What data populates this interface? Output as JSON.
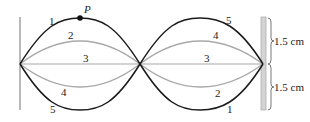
{
  "diagram": {
    "type": "standing-wave",
    "point_label": "P",
    "curves": [
      {
        "id": 1,
        "label_left": "1",
        "label_right": "1",
        "color": "#1a1a1a"
      },
      {
        "id": 2,
        "label_left": "2",
        "label_right": "2",
        "color": "#a0a0a0"
      },
      {
        "id": 3,
        "label_left": "3",
        "label_right": "3",
        "color": "#a0a0a0"
      },
      {
        "id": 4,
        "label_left": "4",
        "label_right": "4",
        "color": "#a0a0a0"
      },
      {
        "id": 5,
        "label_left": "5",
        "label_right": "5",
        "color": "#1a1a1a"
      }
    ],
    "dimensions": {
      "upper": "1.5 cm",
      "lower": "1.5 cm"
    }
  }
}
